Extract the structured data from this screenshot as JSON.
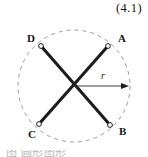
{
  "equation": {
    "number": "(4.1)"
  },
  "figure": {
    "circle": {
      "cx": 74,
      "cy": 86,
      "r": 56,
      "stroke": "#9a9a9a",
      "dash": "4 4",
      "style": "dashed"
    },
    "chords": [
      {
        "name": "chord-D-B",
        "from": "D",
        "to": "B"
      },
      {
        "name": "chord-A-C",
        "from": "A",
        "to": "C"
      }
    ],
    "vertices": [
      {
        "id": "A",
        "label": "A",
        "x": 108,
        "y": 46,
        "label_x": 118,
        "label_y": 42
      },
      {
        "id": "B",
        "label": "B",
        "x": 110,
        "y": 125,
        "label_x": 119,
        "label_y": 135
      },
      {
        "id": "C",
        "label": "C",
        "x": 39,
        "y": 124,
        "label_x": 28,
        "label_y": 138
      },
      {
        "id": "D",
        "label": "D",
        "x": 41,
        "y": 46,
        "label_x": 27,
        "label_y": 42
      }
    ],
    "radius": {
      "label": "r",
      "label_x": 101,
      "label_y": 79,
      "from_x": 74,
      "from_y": 86,
      "to_x": 129,
      "to_y": 86
    },
    "line_color": "#1c1c1c"
  },
  "caption": {
    "text": "图        圆形图形"
  }
}
